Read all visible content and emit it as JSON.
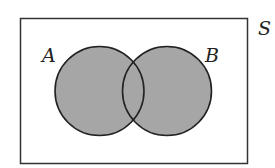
{
  "diagram": {
    "type": "venn",
    "universe_label": "S",
    "sets": [
      {
        "label": "A",
        "shaded": true
      },
      {
        "label": "B",
        "shaded": true
      }
    ],
    "shaded_region": "A ∪ B",
    "colors": {
      "shade": "#a6a6a6",
      "stroke": "#222222",
      "background": "#ffffff"
    }
  }
}
